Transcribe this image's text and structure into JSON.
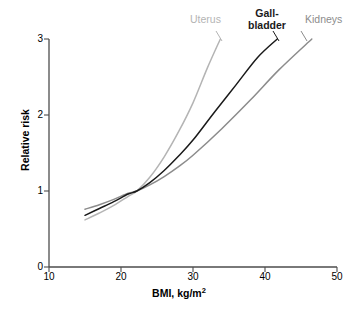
{
  "figure": {
    "background": "#ffffff"
  },
  "axes": {
    "xlabel_main": "BMI, kg/m",
    "xlabel_sup": "2",
    "ylabel": "Relative risk",
    "xticks": [
      "10",
      "20",
      "30",
      "40",
      "50"
    ],
    "yticks": [
      "0",
      "1",
      "2",
      "3"
    ]
  },
  "labels": {
    "uterus": "Uterus",
    "gallbladder": "Gall-\nbladder",
    "kidneys": "Kidneys"
  },
  "colors": {
    "uterus": "#b4b4b4",
    "gallbladder": "#1a1a1a",
    "kidneys": "#8c8c8c",
    "axis": "#4d4d4d",
    "text": "#000000"
  },
  "chart_data": {
    "type": "line",
    "title": "",
    "xlabel": "BMI, kg/m2",
    "ylabel": "Relative risk",
    "xlim": [
      10,
      50
    ],
    "ylim": [
      0,
      3
    ],
    "xticks": [
      10,
      20,
      30,
      40,
      50
    ],
    "yticks": [
      0,
      1,
      2,
      3
    ],
    "grid": false,
    "legend": "inline-curve-labels-top",
    "series": [
      {
        "name": "Uterus",
        "color": "#b4b4b4",
        "x": [
          15,
          17,
          19,
          21,
          22.2,
          24,
          26,
          28,
          30,
          32,
          33.8
        ],
        "values": [
          0.62,
          0.71,
          0.81,
          0.93,
          1.0,
          1.18,
          1.45,
          1.78,
          2.16,
          2.62,
          3.0
        ]
      },
      {
        "name": "Gall-bladder",
        "color": "#1a1a1a",
        "x": [
          15,
          17,
          19,
          21,
          22.2,
          24,
          26,
          28,
          30,
          33,
          36,
          39,
          41.7
        ],
        "values": [
          0.68,
          0.77,
          0.86,
          0.96,
          1.0,
          1.11,
          1.27,
          1.46,
          1.67,
          2.04,
          2.4,
          2.76,
          3.0
        ]
      },
      {
        "name": "Kidneys",
        "color": "#8c8c8c",
        "x": [
          15,
          17,
          19,
          21,
          22.2,
          24,
          26,
          28,
          30,
          34,
          38,
          42,
          46.5
        ],
        "values": [
          0.76,
          0.82,
          0.89,
          0.97,
          1.0,
          1.08,
          1.19,
          1.32,
          1.47,
          1.82,
          2.2,
          2.6,
          3.0
        ]
      }
    ],
    "annotations": [
      {
        "text": "Uterus",
        "x": 33.0,
        "y": 3.2
      },
      {
        "text": "Gall-bladder",
        "x": 40.5,
        "y": 3.3
      },
      {
        "text": "Kidneys",
        "x": 46.0,
        "y": 3.2
      }
    ]
  }
}
